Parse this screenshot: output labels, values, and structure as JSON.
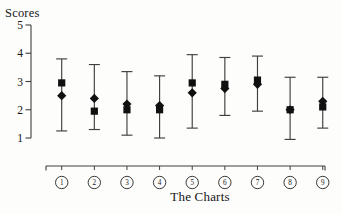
{
  "chart_data": {
    "type": "scatter",
    "title": "",
    "ylabel": "Scores",
    "xlabel": "The Charts",
    "ylim": [
      1,
      5
    ],
    "yticks": [
      5,
      4,
      3,
      2,
      1
    ],
    "categories": [
      "1",
      "2",
      "3",
      "4",
      "5",
      "6",
      "7",
      "8",
      "9"
    ],
    "x_label_style": "circled-numbers",
    "grid": false,
    "legend": "none",
    "series": [
      {
        "name": "square-markers",
        "marker": "square",
        "values": [
          2.95,
          1.95,
          2.0,
          2.0,
          2.95,
          2.9,
          3.05,
          2.0,
          2.1
        ]
      },
      {
        "name": "diamond-markers",
        "marker": "diamond",
        "values": [
          2.5,
          2.4,
          2.2,
          2.15,
          2.6,
          2.75,
          2.9,
          2.0,
          2.3
        ]
      }
    ],
    "error_bars": {
      "high": [
        3.8,
        3.6,
        3.35,
        3.2,
        3.95,
        3.85,
        3.9,
        3.15,
        3.15
      ],
      "low": [
        1.25,
        1.3,
        1.1,
        1.0,
        1.35,
        1.8,
        1.95,
        0.95,
        1.35
      ]
    },
    "colors": {
      "axis": "#3f3f3f",
      "marker": "#101010",
      "text": "#161616",
      "background": "#fdfdfc"
    }
  }
}
